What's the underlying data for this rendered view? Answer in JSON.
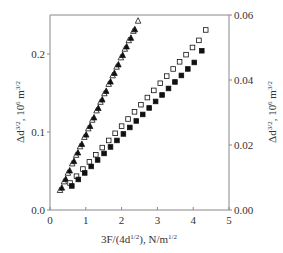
{
  "chart_data": {
    "type": "scatter",
    "title": "",
    "xlabel": "3F/(4d^{1/2}), N/m^{1/2}",
    "ylabel_left": "Δd^{3/2}, 10^6 m^{3/2}",
    "ylabel_right": "Δd^{3/2}, 10^6 m^{3/2}",
    "xlim": [
      0,
      5
    ],
    "ylim_left": [
      0,
      0.25
    ],
    "ylim_right": [
      0,
      0.06
    ],
    "x_ticks": [
      "0",
      "1",
      "2",
      "3",
      "4",
      "5"
    ],
    "y_ticks_left": [
      "0.0",
      "0.1",
      "0.2"
    ],
    "y_ticks_right": [
      "0.00",
      "0.02",
      "0.04",
      "0.06"
    ],
    "grid": false,
    "legend": null,
    "series": [
      {
        "name": "open-triangles",
        "marker": "triangle-open",
        "axis": "left",
        "x": [
          0.28,
          0.39,
          0.5,
          0.62,
          0.73,
          0.84,
          0.96,
          1.07,
          1.18,
          1.3,
          1.41,
          1.52,
          1.64,
          1.75,
          1.86,
          1.98,
          2.09,
          2.2,
          2.33,
          2.46
        ],
        "y": [
          0.026,
          0.037,
          0.048,
          0.06,
          0.071,
          0.082,
          0.094,
          0.105,
          0.116,
          0.128,
          0.139,
          0.15,
          0.162,
          0.173,
          0.184,
          0.196,
          0.207,
          0.218,
          0.23,
          0.243
        ]
      },
      {
        "name": "filled-triangles",
        "marker": "triangle-filled",
        "axis": "left",
        "x": [
          0.33,
          0.44,
          0.55,
          0.67,
          0.78,
          0.89,
          1.01,
          1.12,
          1.23,
          1.35,
          1.46,
          1.57,
          1.69,
          1.8,
          1.91,
          2.03,
          2.14,
          2.26,
          2.37
        ],
        "y": [
          0.029,
          0.04,
          0.051,
          0.063,
          0.074,
          0.085,
          0.097,
          0.108,
          0.119,
          0.131,
          0.142,
          0.153,
          0.165,
          0.176,
          0.187,
          0.199,
          0.21,
          0.221,
          0.232
        ]
      },
      {
        "name": "open-squares",
        "marker": "square-open",
        "axis": "right",
        "x": [
          0.56,
          0.74,
          0.92,
          1.1,
          1.28,
          1.46,
          1.64,
          1.82,
          2.0,
          2.18,
          2.36,
          2.54,
          2.72,
          2.9,
          3.08,
          3.26,
          3.44,
          3.62,
          3.8,
          3.98,
          4.16,
          4.35
        ],
        "y": [
          0.0083,
          0.0104,
          0.0126,
          0.0148,
          0.017,
          0.0192,
          0.0214,
          0.0236,
          0.0258,
          0.028,
          0.0302,
          0.0324,
          0.0346,
          0.0368,
          0.039,
          0.0412,
          0.0434,
          0.0456,
          0.0478,
          0.05,
          0.0522,
          0.0554
        ]
      },
      {
        "name": "filled-squares",
        "marker": "square-filled",
        "axis": "right",
        "x": [
          0.61,
          0.79,
          0.97,
          1.15,
          1.33,
          1.51,
          1.69,
          1.87,
          2.05,
          2.23,
          2.41,
          2.59,
          2.77,
          2.95,
          3.13,
          3.31,
          3.49,
          3.67,
          3.85,
          4.03,
          4.24
        ],
        "y": [
          0.0074,
          0.0094,
          0.0114,
          0.0134,
          0.0154,
          0.0174,
          0.0194,
          0.0214,
          0.0234,
          0.0254,
          0.0274,
          0.0294,
          0.0314,
          0.0334,
          0.0354,
          0.0374,
          0.0394,
          0.0414,
          0.0434,
          0.0454,
          0.049
        ]
      }
    ]
  },
  "labels": {
    "x_axis_title_main": "3F/(4d",
    "x_axis_title_sup1": "1/2",
    "x_axis_title_mid": "), N/m",
    "x_axis_title_sup2": "1/2",
    "y_left_title_main": "Δd",
    "y_left_title_sup1": "3/2",
    "y_left_title_mid": ", 10",
    "y_left_title_sup2": "6",
    "y_left_title_end": " m",
    "y_left_title_sup3": "3/2",
    "y_right_title_main": "Δd",
    "y_right_title_sup1": "3/2",
    "y_right_title_mid": ", 10",
    "y_right_title_sup2": "6",
    "y_right_title_end": " m",
    "y_right_title_sup3": "3/2"
  },
  "colors": {
    "axis": "#888888",
    "marker": "#111111",
    "text": "#333333"
  }
}
